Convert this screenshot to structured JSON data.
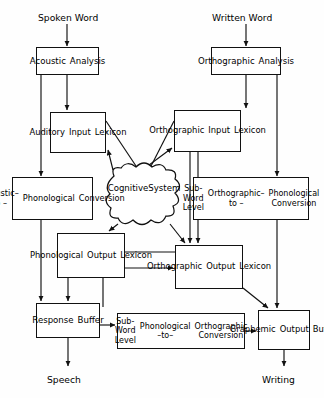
{
  "diagram": {
    "stroke_color": "#111111",
    "background_color": "#fefefe"
  },
  "terminals": [
    {
      "id": "spoken-word",
      "label": "Spoken Word",
      "x": 38,
      "y": 12,
      "size": 9.2
    },
    {
      "id": "written-word",
      "label": "Written  Word",
      "x": 212,
      "y": 12,
      "size": 9.2
    },
    {
      "id": "speech",
      "label": "Speech",
      "x": 47,
      "y": 374,
      "size": 9.2
    },
    {
      "id": "writing",
      "label": "Writing",
      "x": 262,
      "y": 374,
      "size": 9.2
    }
  ],
  "boxes": [
    {
      "id": "acoustic-analysis",
      "lines": [
        "Acoustic",
        "Analysis"
      ],
      "x": 36,
      "y": 47,
      "w": 63,
      "h": 28,
      "size": 8.6
    },
    {
      "id": "orthographic-analysis",
      "lines": [
        "Orthographic",
        "Analysis"
      ],
      "x": 211,
      "y": 47,
      "w": 70,
      "h": 28,
      "size": 8.6
    },
    {
      "id": "auditory-input-lexicon",
      "lines": [
        "Auditory",
        "Input",
        "Lexicon"
      ],
      "x": 50,
      "y": 112,
      "w": 56,
      "h": 41,
      "size": 8.4
    },
    {
      "id": "orthographic-input-lexicon",
      "lines": [
        "Orthographic",
        "Input",
        "Lexicon"
      ],
      "x": 174,
      "y": 110,
      "w": 67,
      "h": 42,
      "size": 8.4
    },
    {
      "id": "acoustic-to-phonological-conversion",
      "lines": [
        "Acoustic–to –",
        "Phonological",
        "Conversion"
      ],
      "x": 12,
      "y": 177,
      "w": 81,
      "h": 43,
      "size": 8.2
    },
    {
      "id": "subword-orthographic-to-phonological-conversion",
      "lines": [
        "Sub-Word Level",
        "Orthographic– to –",
        "Phonological Conversion"
      ],
      "x": 193,
      "y": 177,
      "w": 116,
      "h": 43,
      "size": 8.0
    },
    {
      "id": "phonological-output-lexicon",
      "lines": [
        "Phonological",
        "Output",
        "Lexicon"
      ],
      "x": 57,
      "y": 233,
      "w": 68,
      "h": 45,
      "size": 8.4
    },
    {
      "id": "orthographic-output-lexicon",
      "lines": [
        "Orthographic",
        "Output",
        "Lexicon"
      ],
      "x": 175,
      "y": 245,
      "w": 68,
      "h": 44,
      "size": 8.4
    },
    {
      "id": "response-buffer",
      "lines": [
        "Response",
        "Buffer"
      ],
      "x": 36,
      "y": 303,
      "w": 64,
      "h": 35,
      "size": 8.6
    },
    {
      "id": "subword-phonological-to-orthographic-conversion",
      "lines": [
        "Sub-Word  Level",
        "Phonological –to–",
        "Orthographic  Conversion"
      ],
      "x": 117,
      "y": 313,
      "w": 128,
      "h": 36,
      "size": 8.0
    },
    {
      "id": "graphemic-output-buffer",
      "lines": [
        "Graphemic",
        "Output",
        "Buffer"
      ],
      "x": 258,
      "y": 310,
      "w": 52,
      "h": 40,
      "size": 8.4
    }
  ],
  "cloud": {
    "id": "cognitive-system",
    "lines": [
      "Cognitive",
      "System"
    ],
    "x": 106,
    "y": 168,
    "w": 76,
    "h": 60,
    "size": 8.6
  },
  "connections": [
    {
      "from": "spoken-word",
      "to": "acoustic-analysis"
    },
    {
      "from": "written-word",
      "to": "orthographic-analysis"
    },
    {
      "from": "acoustic-analysis",
      "to": "auditory-input-lexicon"
    },
    {
      "from": "acoustic-analysis",
      "to": "acoustic-to-phonological-conversion"
    },
    {
      "from": "orthographic-analysis",
      "to": "orthographic-input-lexicon"
    },
    {
      "from": "orthographic-analysis",
      "to": "subword-orthographic-to-phonological-conversion"
    },
    {
      "from": "auditory-input-lexicon",
      "to": "cognitive-system"
    },
    {
      "from": "cognitive-system",
      "to": "auditory-input-lexicon"
    },
    {
      "from": "orthographic-input-lexicon",
      "to": "cognitive-system"
    },
    {
      "from": "cognitive-system",
      "to": "orthographic-input-lexicon"
    },
    {
      "from": "cognitive-system",
      "to": "phonological-output-lexicon"
    },
    {
      "from": "cognitive-system",
      "to": "orthographic-output-lexicon"
    },
    {
      "from": "orthographic-input-lexicon",
      "to": "orthographic-output-lexicon"
    },
    {
      "from": "phonological-output-lexicon",
      "to": "orthographic-output-lexicon"
    },
    {
      "from": "acoustic-to-phonological-conversion",
      "to": "response-buffer"
    },
    {
      "from": "subword-orthographic-to-phonological-conversion",
      "to": "graphemic-output-buffer"
    },
    {
      "from": "phonological-output-lexicon",
      "to": "response-buffer"
    },
    {
      "from": "orthographic-output-lexicon",
      "to": "graphemic-output-buffer"
    },
    {
      "from": "orthographic-output-lexicon",
      "to": "response-buffer"
    },
    {
      "from": "response-buffer",
      "to": "subword-phonological-to-orthographic-conversion"
    },
    {
      "from": "subword-phonological-to-orthographic-conversion",
      "to": "graphemic-output-buffer"
    },
    {
      "from": "response-buffer",
      "to": "speech"
    },
    {
      "from": "graphemic-output-buffer",
      "to": "writing"
    }
  ]
}
